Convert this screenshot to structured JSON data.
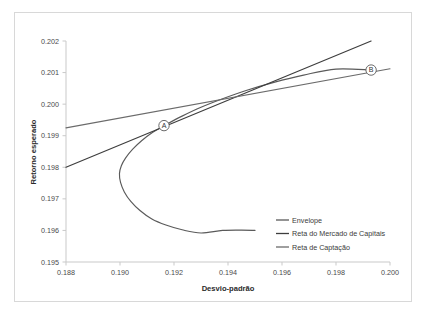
{
  "chart_data": {
    "type": "line",
    "title": "",
    "xlabel": "Desvio-padrão",
    "ylabel": "Retorno esperado",
    "xlim": [
      0.188,
      0.2
    ],
    "ylim": [
      0.195,
      0.202
    ],
    "xticks": [
      "0.188",
      "0.190",
      "0.192",
      "0.194",
      "0.196",
      "0.198",
      "0.200"
    ],
    "xtick_values": [
      0.188,
      0.19,
      0.192,
      0.194,
      0.196,
      0.198,
      0.2
    ],
    "yticks": [
      "0.195",
      "0.196",
      "0.197",
      "0.198",
      "0.199",
      "0.200",
      "0.201",
      "0.202"
    ],
    "ytick_values": [
      0.195,
      0.196,
      0.197,
      0.198,
      0.199,
      0.2,
      0.201,
      0.202
    ],
    "grid": false,
    "legend_position": "inside-lower-right",
    "series": [
      {
        "name": "Envelope",
        "color": "#5a5a5a",
        "type": "curve",
        "points": [
          [
            0.19163,
            0.19932
          ],
          [
            0.1912,
            0.1991
          ],
          [
            0.1908,
            0.19884
          ],
          [
            0.19048,
            0.19858
          ],
          [
            0.19021,
            0.1983
          ],
          [
            0.19005,
            0.19805
          ],
          [
            0.18998,
            0.1978
          ],
          [
            0.19002,
            0.19752
          ],
          [
            0.19016,
            0.19722
          ],
          [
            0.1904,
            0.19692
          ],
          [
            0.19074,
            0.19663
          ],
          [
            0.19118,
            0.19636
          ],
          [
            0.1917,
            0.19617
          ],
          [
            0.1923,
            0.19602
          ],
          [
            0.193,
            0.19592
          ],
          [
            0.1938,
            0.196
          ],
          [
            0.1945,
            0.19601
          ],
          [
            0.195,
            0.196
          ]
        ],
        "upper_branch_extension": [
          [
            0.19163,
            0.19932
          ],
          [
            0.1923,
            0.19962
          ],
          [
            0.193,
            0.1999
          ],
          [
            0.1938,
            0.20017
          ],
          [
            0.1947,
            0.20044
          ],
          [
            0.1957,
            0.20069
          ],
          [
            0.1968,
            0.20092
          ],
          [
            0.198,
            0.20111
          ],
          [
            0.1993,
            0.20108
          ]
        ]
      },
      {
        "name": "Reta do Mercado de Capitais",
        "color": "#3d3d3d",
        "type": "straight",
        "points": [
          [
            0.188,
            0.198
          ],
          [
            0.1993,
            0.202
          ]
        ]
      },
      {
        "name": "Reta de Captação",
        "color": "#6b6b6b",
        "type": "straight",
        "points": [
          [
            0.188,
            0.19925
          ],
          [
            0.2,
            0.20112
          ]
        ]
      }
    ],
    "annotations": [
      {
        "label": "A",
        "x": 0.19163,
        "y": 0.19932
      },
      {
        "label": "B",
        "x": 0.1993,
        "y": 0.20108
      }
    ]
  },
  "legend": {
    "items": [
      {
        "label": "Envelope"
      },
      {
        "label": "Reta do Mercado de Capitais"
      },
      {
        "label": "Reta de Captação"
      }
    ]
  },
  "colors": {
    "envelope": "#5a5a5a",
    "capital_market_line": "#3d3d3d",
    "borrowing_line": "#6b6b6b",
    "axis": "#c9c9c9",
    "border": "#d8d8d8",
    "text": "#3a3a3a"
  }
}
